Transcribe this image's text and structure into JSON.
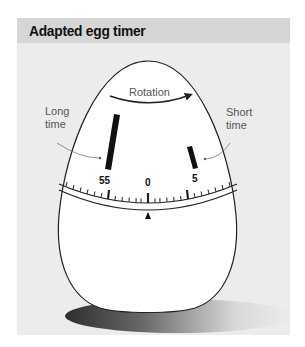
{
  "header": {
    "title": "Adapted egg timer"
  },
  "diagram": {
    "rotation_label": "Rotation",
    "long_label_line1": "Long",
    "long_label_line2": "time",
    "short_label_line1": "Short",
    "short_label_line2": "time",
    "dial_numbers": {
      "left": "55",
      "center": "0",
      "right": "5"
    },
    "colors": {
      "panel_bg": "#ececec",
      "header_bg": "#d6d6d6",
      "egg_fill": "#ffffff",
      "outline": "#222222",
      "shadow_dark": "#3a3a3a"
    }
  }
}
